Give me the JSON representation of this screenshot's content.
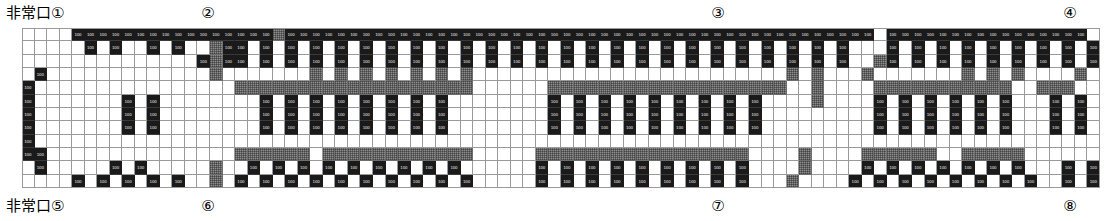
{
  "plan": {
    "title": "非常口付き会場レイアウト図",
    "exit_text": "非常口",
    "grid": {
      "columns": 86,
      "rows": 12,
      "cell_label": "100",
      "legend": {
        "black_cell": "ブース (booth)",
        "gray_cell": "通路・間仕切り (aisle/partition)",
        "white_cell": "空き (open)"
      },
      "colors": {
        "black": "#1a1a1a",
        "gray": "#8d8d8d",
        "white": "#ffffff",
        "gridline": "#9a9a9a"
      }
    }
  },
  "top_labels": {
    "exit_label": "非常口①",
    "markers": [
      {
        "text": "②",
        "x": 208
      },
      {
        "text": "③",
        "x": 718
      },
      {
        "text": "④",
        "x": 1070
      }
    ]
  },
  "bottom_labels": {
    "exit_label": "非常口⑤",
    "markers": [
      {
        "text": "⑥",
        "x": 208
      },
      {
        "text": "⑦",
        "x": 718
      },
      {
        "text": "⑧",
        "x": 1070
      }
    ]
  },
  "chart_data": {
    "type": "heatmap",
    "xlabel": "",
    "ylabel": "",
    "grid": true,
    "legend_position": "none",
    "categories": [
      "white",
      "black",
      "gray",
      "hatch"
    ],
    "cell_value_label": "100",
    "rows": [
      "wwwwkkkkkkkkkkkkkkkkgkkkkkkkkkkkkkkkkkkkkkkkkkkkkkkkkkkkkkkkkkkkkkkkwkkkkkkkkkkkkkkkkw",
      "wwwwwkwkwwkwkwwgkkwkwkwkwkwkwkwkwkwkwkwkwkwkwkwkwkwkwkwkwkwkwkwkwkwwwkwkwkwkwkwkwkwkwk",
      "wwwwwwwwwwwwwwkgkkwkwkwkwkwkwkwkwkwkwkwkwkwkwkwkwkwkwkwkwkwkwkwkwkwwgkwkwkwkwkwkwkwkwk",
      "wkwwwwwwwwwwwwwgwwwwwwwgwgwgwgwgwgwgwwwwwwwwwwwwwwwwwwwwwwwwwgwgwwwgwwwwwwwgwgwgwwwwgw",
      "kwwwwwwwwwwwwwwwwgggggggggggggggggggwwwwwwgggggggggggggggggggwwgwwwwgggggggggggwwgggww",
      "kwwwwwwwkwkwwwwwwwwkwkwkwkwkwkwkwkwwwwwwwwkwkwkwkwkwkwkwkwkwwwwgwwwwkwkwkwkwkwkwwwkwkww",
      "kwwwwwwwkwkwwwwwwwwkwkwkwkwkwkwkwkwwwwwwwwkwkwkwkwkwkwkwkwkwwwwwwwwwkwkwkwkwkwkwwwkwkww",
      "kwwwwwwwkwkwwwwwwwwkwkwkwkwkwkwkwkwwwwwwwwkwkwkwkwkwkwkwkwkwwwwwwwwwkwkwkwkwkwkwwwkwkww",
      "kwwwwwwwwwwwwwwwwwwwwwwwwwwwwwwwwwwwwwwwwwwwwwwwwwwwwwwwwwwwwwwwwwwwwwwwwwwwwwwwwwwwww",
      "kkwwwwwwwwwwwwwwwggggggwggggggggggggwwwwwgggggggggggggggggwwwwgwwwwggggggwwgggggwwwwwww",
      "wkwwwwwkwkwwwwwgwwkwkwkwkwkwkwkwkwkwwwwwwkwkwkwkwkwkwkwkwkwwwwgwwwwkwkwkwkwkwkwkwwwkwkw",
      "wwwwkwkwkwkwkwwgwkwkwkwkwkwkwkwkwkwkwwwwwkwkwkwkwkwkwkwkwkwwwgwwwwkwkwkwkwkwkwkwkwwkwkw"
    ],
    "note": "Each character encodes one cell: w=white, k=black(booth), g=gray(aisle), x=hatched"
  }
}
